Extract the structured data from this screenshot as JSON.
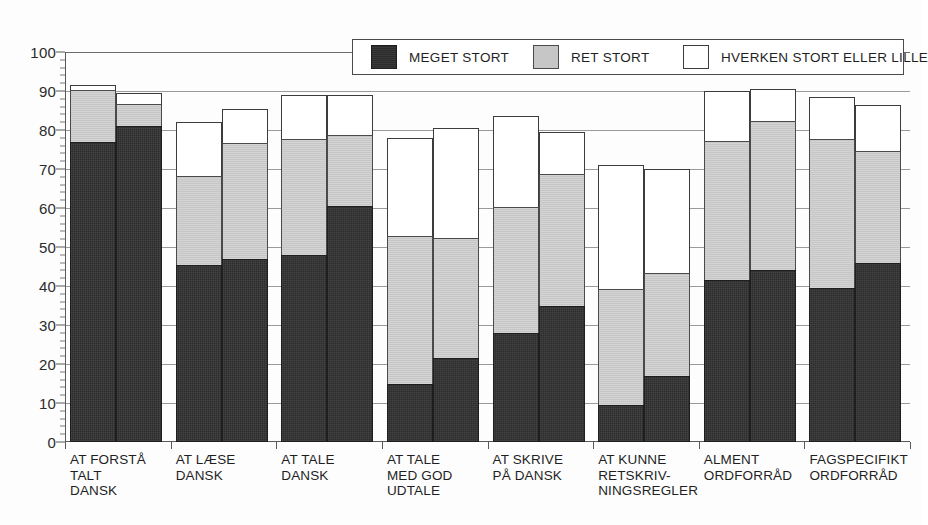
{
  "chart_data": {
    "type": "bar",
    "subtype": "stacked-grouped",
    "title": "",
    "xlabel": "",
    "ylabel": "",
    "ylim": [
      0,
      100
    ],
    "ytick_step": 10,
    "yminor_step": 2,
    "grid": true,
    "legend_position": "top-right-inside",
    "yticks": [
      "0",
      "10",
      "20",
      "30",
      "40",
      "50",
      "60",
      "70",
      "80",
      "90",
      "100"
    ],
    "categories": [
      "AT FORSTÅ\nTALT\nDANSK",
      "AT LÆSE\nDANSK",
      "AT TALE\nDANSK",
      "AT TALE\nMED GOD\nUDTALE",
      "AT SKRIVE\nPÅ DANSK",
      "AT KUNNE\nRETSKRIV-\nNINGSREGLER",
      "ALMENT\nORDFORRÅD",
      "FAGSPECIFIKT\nORDFORRÅD"
    ],
    "series": [
      {
        "name": "MEGET STORT",
        "color": "#2c2c2c",
        "bar_a": [
          77,
          45.5,
          48,
          15,
          28,
          9.5,
          41.5,
          39.5
        ],
        "bar_b": [
          81,
          47,
          60.5,
          21.5,
          35,
          17,
          44,
          46
        ]
      },
      {
        "name": "RET STORT",
        "color": "#c6c6c6",
        "bar_a": [
          13.5,
          23,
          30,
          38,
          32.5,
          30,
          36,
          38.5
        ],
        "bar_b": [
          6,
          30,
          18.5,
          31,
          34,
          26.5,
          38.5,
          29
        ]
      },
      {
        "name": "HVERKEN STORT ELLER LILLE",
        "color": "#ffffff",
        "bar_a": [
          1.5,
          14,
          11.5,
          25.5,
          23.5,
          32,
          13,
          11
        ],
        "bar_b": [
          3,
          9,
          10.5,
          28.5,
          11,
          27,
          8.5,
          12
        ]
      }
    ],
    "cumulative_tops": {
      "bar_a_meget": [
        77,
        45.5,
        48,
        15,
        28,
        9.5,
        41.5,
        39.5
      ],
      "bar_a_ret": [
        90.5,
        68.5,
        78,
        53,
        60.5,
        39.5,
        77.5,
        78
      ],
      "bar_a_total": [
        92,
        82.5,
        89.5,
        78.5,
        84,
        71.5,
        90.5,
        89
      ],
      "bar_b_meget": [
        81,
        47,
        60.5,
        21.5,
        35,
        17,
        44,
        46
      ],
      "bar_b_ret": [
        87,
        77,
        79,
        52.5,
        69,
        43.5,
        82.5,
        75
      ],
      "bar_b_total": [
        90,
        86,
        89.5,
        81,
        80,
        70.5,
        91,
        87
      ]
    }
  },
  "legend": {
    "items": [
      {
        "label": "MEGET STORT",
        "swatch": "s-meget"
      },
      {
        "label": "RET STORT",
        "swatch": "s-ret"
      },
      {
        "label": "HVERKEN STORT ELLER LILLE",
        "swatch": "s-hverken"
      }
    ]
  }
}
